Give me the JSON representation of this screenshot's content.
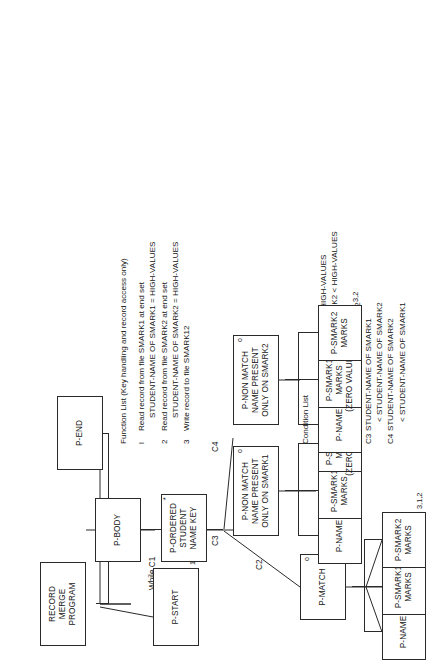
{
  "diagram": {
    "type": "jackson-structure-diagram",
    "orientation": "rotated-90-ccw",
    "root": {
      "lines": [
        "RECORD",
        "MERGE",
        "PROGRAM"
      ]
    },
    "nodes": [
      {
        "id": "p-start",
        "lines": [
          "P-START"
        ],
        "marker": "",
        "fn": "1,2"
      },
      {
        "id": "p-body",
        "lines": [
          "P-BODY"
        ],
        "marker": "",
        "fn": ""
      },
      {
        "id": "p-end",
        "lines": [
          "P-END"
        ],
        "marker": "",
        "fn": ""
      },
      {
        "id": "p-ordered",
        "lines": [
          "P-ORDERED",
          "STUDENT",
          "NAME KEY"
        ],
        "marker": "*",
        "fn": ""
      },
      {
        "id": "p-match",
        "lines": [
          "P-MATCH"
        ],
        "marker": "o",
        "fn": ""
      },
      {
        "id": "p-nm1",
        "lines": [
          "P-NON MATCH",
          "NAME PRESENT",
          "ONLY ON SMARK1"
        ],
        "marker": "o",
        "fn": ""
      },
      {
        "id": "p-nm2",
        "lines": [
          "P-NON MATCH",
          "NAME PRESENT",
          "ONLY ON SMARK2"
        ],
        "marker": "o",
        "fn": ""
      },
      {
        "id": "m-name",
        "lines": [
          "P-NAME"
        ],
        "marker": "",
        "fn": ""
      },
      {
        "id": "m-s1",
        "lines": [
          "P-SMARK1",
          "MARKS"
        ],
        "marker": "",
        "fn": ""
      },
      {
        "id": "m-s2",
        "lines": [
          "P-SMARK2",
          "MARKS"
        ],
        "marker": "",
        "fn": "3,1,2"
      },
      {
        "id": "n1-name",
        "lines": [
          "P-NAME"
        ],
        "marker": "",
        "fn": ""
      },
      {
        "id": "n1-s1",
        "lines": [
          "P-SMARK1",
          "MARKS"
        ],
        "marker": "",
        "fn": ""
      },
      {
        "id": "n1-s2",
        "lines": [
          "P-SMARK2",
          "MARKS",
          "(ZERO VALUES)"
        ],
        "marker": "",
        "fn": "3,1"
      },
      {
        "id": "n2-name",
        "lines": [
          "P-NAME"
        ],
        "marker": "",
        "fn": ""
      },
      {
        "id": "n2-s1",
        "lines": [
          "P-SMARK1",
          "MARKS",
          "(ZERO VALUES)"
        ],
        "marker": "",
        "fn": ""
      },
      {
        "id": "n2-s2",
        "lines": [
          "P-SMARK2",
          "MARKS"
        ],
        "marker": "",
        "fn": "3,2"
      }
    ],
    "edge_labels": {
      "while_c1": "While C1",
      "c2": "C2",
      "c3": "C3",
      "c4": "C4"
    }
  },
  "condition_list": {
    "title": "Condition List",
    "items": [
      {
        "id": "CI",
        "lines": [
          "STUDENT-NAME OF SMARK1 < HIGH-VALUES",
          "OR STUDENT-NAME OF SMARK2 < HIGH-VALUES"
        ]
      },
      {
        "id": "C2",
        "lines": [
          "STUDENT-NAME OF SMARK1",
          "= STUDENT-NAME OF SMARK2"
        ]
      },
      {
        "id": "C3",
        "lines": [
          "STUDENT-NAME OF SMARK1",
          "< STUDENT-NAME OF SMARK2"
        ]
      },
      {
        "id": "C4",
        "lines": [
          "STUDENT-NAME OF SMARK2",
          "< STUDENT-NAME OF SMARK1"
        ]
      }
    ]
  },
  "function_list": {
    "title": "Function List (Key handling and record access only)",
    "items": [
      {
        "id": "l",
        "lines": [
          "Read record from file SMARK1 at end set",
          "STUDENT-NAME OF SMARK1 = HIGH-VALUES"
        ]
      },
      {
        "id": "2",
        "lines": [
          "Read record from file SMARK2 at end set",
          "STUDENT-NAME OF SMARK2 = HIGH-VALUES"
        ]
      },
      {
        "id": "3",
        "lines": [
          "Write record to file SMARK12"
        ]
      }
    ]
  },
  "colors": {
    "ink": "#161616",
    "line": "#2a2a2a",
    "paper": "#ffffff"
  }
}
